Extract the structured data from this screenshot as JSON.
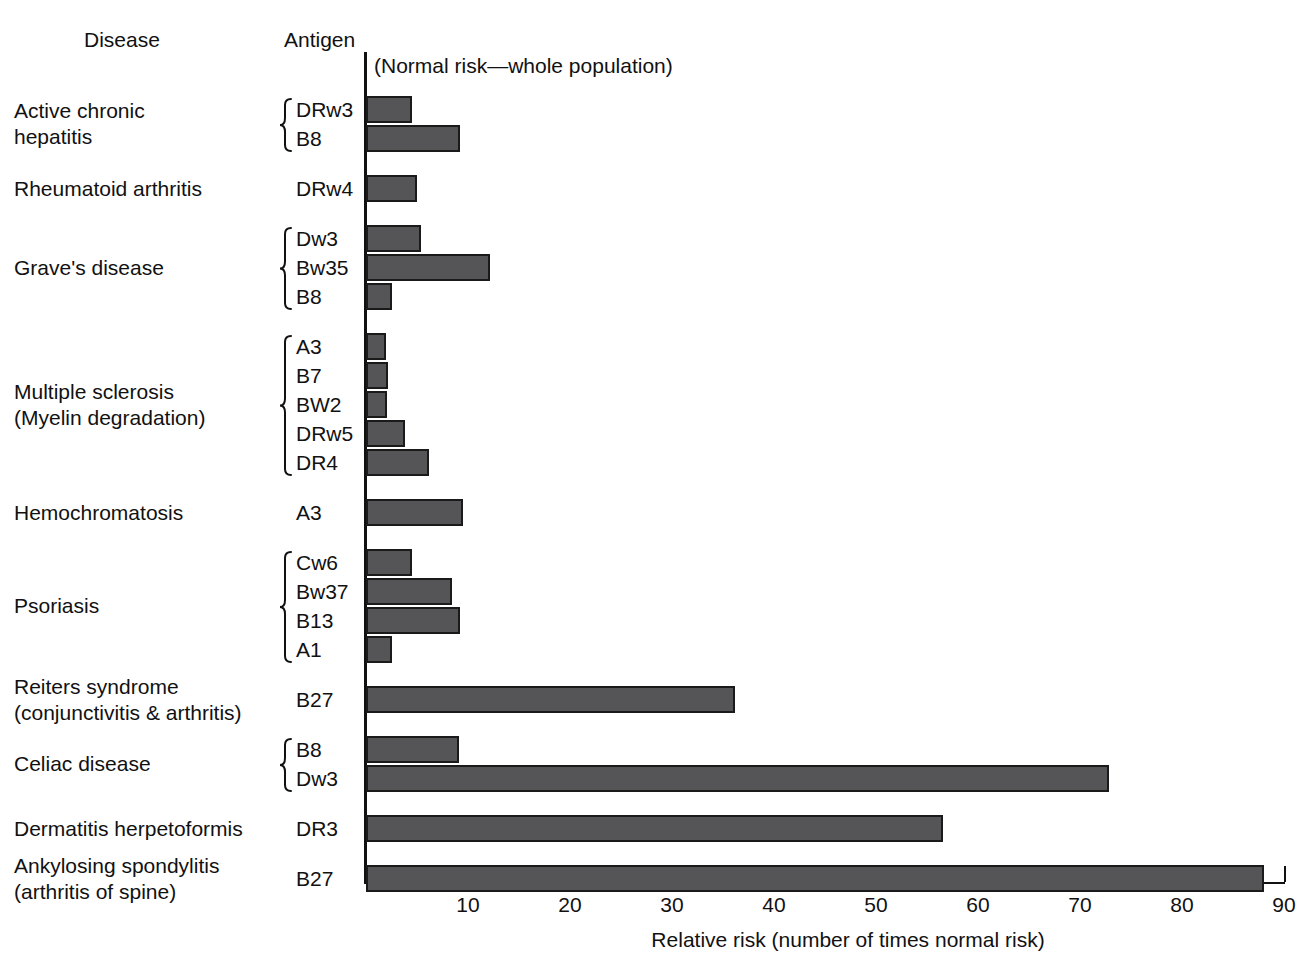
{
  "headers": {
    "disease": "Disease",
    "antigen": "Antigen"
  },
  "annotation": "(Normal risk—whole population)",
  "axis": {
    "title": "Relative risk (number of times normal risk)",
    "ticks": [
      "10",
      "20",
      "30",
      "40",
      "50",
      "60",
      "70",
      "80",
      "90"
    ]
  },
  "colors": {
    "bar_fill": "#555558",
    "bar_stroke": "#1a1a1a",
    "axis": "#111111",
    "text": "#111111",
    "background": "#ffffff"
  },
  "groups": [
    {
      "disease": "Active chronic\nhepatitis",
      "braced": true,
      "rows": [
        {
          "antigen": "DRw3",
          "value": 4.5
        },
        {
          "antigen": "B8",
          "value": 9.2
        }
      ]
    },
    {
      "disease": "Rheumatoid arthritis",
      "braced": false,
      "rows": [
        {
          "antigen": "DRw4",
          "value": 5.0
        }
      ]
    },
    {
      "disease": "Grave's disease",
      "braced": true,
      "rows": [
        {
          "antigen": "Dw3",
          "value": 5.4
        },
        {
          "antigen": "Bw35",
          "value": 12.2
        },
        {
          "antigen": "B8",
          "value": 2.5
        }
      ]
    },
    {
      "disease": "Multiple sclerosis\n(Myelin degradation)",
      "braced": true,
      "rows": [
        {
          "antigen": "A3",
          "value": 2.0
        },
        {
          "antigen": "B7",
          "value": 2.2
        },
        {
          "antigen": "BW2",
          "value": 2.1
        },
        {
          "antigen": "DRw5",
          "value": 3.8
        },
        {
          "antigen": "DR4",
          "value": 6.2
        }
      ]
    },
    {
      "disease": "Hemochromatosis",
      "braced": false,
      "rows": [
        {
          "antigen": "A3",
          "value": 9.5
        }
      ]
    },
    {
      "disease": "Psoriasis",
      "braced": true,
      "rows": [
        {
          "antigen": "Cw6",
          "value": 4.5
        },
        {
          "antigen": "Bw37",
          "value": 8.4
        },
        {
          "antigen": "B13",
          "value": 9.2
        },
        {
          "antigen": "A1",
          "value": 2.5
        }
      ]
    },
    {
      "disease": "Reiters syndrome\n(conjunctivitis & arthritis)",
      "braced": false,
      "rows": [
        {
          "antigen": "B27",
          "value": 36.2
        }
      ]
    },
    {
      "disease": "Celiac disease",
      "braced": true,
      "rows": [
        {
          "antigen": "B8",
          "value": 9.1
        },
        {
          "antigen": "Dw3",
          "value": 72.8
        }
      ]
    },
    {
      "disease": "Dermatitis herpetoformis",
      "braced": false,
      "rows": [
        {
          "antigen": "DR3",
          "value": 56.6
        }
      ]
    },
    {
      "disease": "Ankylosing spondylitis\n(arthritis of spine)",
      "braced": false,
      "rows": [
        {
          "antigen": "B27",
          "value": 88.0
        }
      ]
    }
  ],
  "chart_data": {
    "type": "bar",
    "orientation": "horizontal",
    "title": "",
    "xlabel": "Relative risk (number of times normal risk)",
    "ylabel": "",
    "xlim": [
      0,
      92
    ],
    "xticks": [
      10,
      20,
      30,
      40,
      50,
      60,
      70,
      80,
      90
    ],
    "grid": false,
    "legend": null,
    "annotations": [
      "(Normal risk—whole population)"
    ],
    "column_headers": [
      "Disease",
      "Antigen"
    ],
    "categories": [
      "Active chronic hepatitis — DRw3",
      "Active chronic hepatitis — B8",
      "Rheumatoid arthritis — DRw4",
      "Grave's disease — Dw3",
      "Grave's disease — Bw35",
      "Grave's disease — B8",
      "Multiple sclerosis (Myelin degradation) — A3",
      "Multiple sclerosis (Myelin degradation) — B7",
      "Multiple sclerosis (Myelin degradation) — BW2",
      "Multiple sclerosis (Myelin degradation) — DRw5",
      "Multiple sclerosis (Myelin degradation) — DR4",
      "Hemochromatosis — A3",
      "Psoriasis — Cw6",
      "Psoriasis — Bw37",
      "Psoriasis — B13",
      "Psoriasis — A1",
      "Reiters syndrome (conjunctivitis & arthritis) — B27",
      "Celiac disease — B8",
      "Celiac disease — Dw3",
      "Dermatitis herpetoformis — DR3",
      "Ankylosing spondylitis (arthritis of spine) — B27"
    ],
    "values": [
      4.5,
      9.2,
      5.0,
      5.4,
      12.2,
      2.5,
      2.0,
      2.2,
      2.1,
      3.8,
      6.2,
      9.5,
      4.5,
      8.4,
      9.2,
      2.5,
      36.2,
      9.1,
      72.8,
      56.6,
      88.0
    ]
  }
}
